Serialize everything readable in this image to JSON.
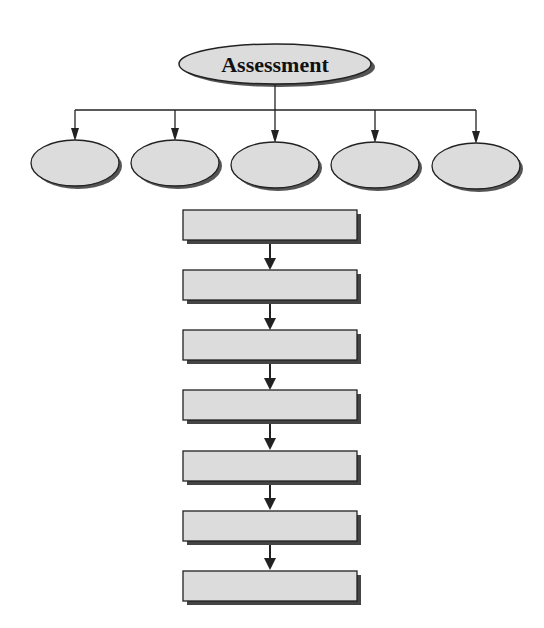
{
  "diagram": {
    "title": "Assessment",
    "colors": {
      "fill": "#dcdcdc",
      "shadow": "#555555",
      "stroke": "#222222",
      "background": "#ffffff"
    },
    "branch_ellipses": [
      {
        "label": ""
      },
      {
        "label": ""
      },
      {
        "label": ""
      },
      {
        "label": ""
      },
      {
        "label": ""
      }
    ],
    "flow_boxes": [
      {
        "label": ""
      },
      {
        "label": ""
      },
      {
        "label": ""
      },
      {
        "label": ""
      },
      {
        "label": ""
      },
      {
        "label": ""
      },
      {
        "label": ""
      }
    ]
  }
}
